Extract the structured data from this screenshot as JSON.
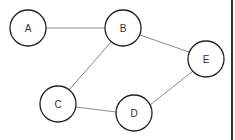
{
  "diagram": {
    "type": "undirected-graph",
    "colors": {
      "edge": "#8a8a8a",
      "node_stroke": "#222222",
      "node_fill": "#ffffff",
      "label": "#333333",
      "border": "#333333"
    },
    "nodes": [
      {
        "id": "A",
        "label": "A",
        "x": 28,
        "y": 28,
        "r": 18
      },
      {
        "id": "B",
        "label": "B",
        "x": 123,
        "y": 28,
        "r": 18
      },
      {
        "id": "C",
        "label": "C",
        "x": 58,
        "y": 104,
        "r": 18
      },
      {
        "id": "D",
        "label": "D",
        "x": 134,
        "y": 113,
        "r": 18
      },
      {
        "id": "E",
        "label": "E",
        "x": 206,
        "y": 59,
        "r": 18
      }
    ],
    "edges": [
      {
        "from": "A",
        "to": "B"
      },
      {
        "from": "B",
        "to": "E"
      },
      {
        "from": "B",
        "to": "C"
      },
      {
        "from": "C",
        "to": "D"
      },
      {
        "from": "D",
        "to": "E"
      }
    ]
  }
}
